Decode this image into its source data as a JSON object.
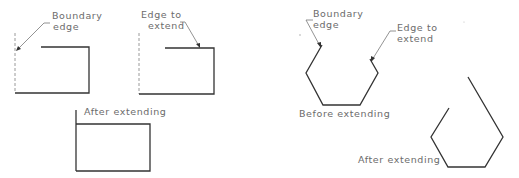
{
  "figure": {
    "left_panel": {
      "before_boundary": {
        "label_line1": "Boundary",
        "label_line2": "edge"
      },
      "before_edge": {
        "label_line1": "Edge to",
        "label_line2": "extend"
      },
      "after": {
        "label": "After extending"
      }
    },
    "right_panel": {
      "before": {
        "boundary_label_line1": "Boundary",
        "boundary_label_line2": "edge",
        "edge_label_line1": "Edge to",
        "edge_label_line2": "extend",
        "caption": "Before extending"
      },
      "after": {
        "caption": "After extending"
      }
    },
    "colors": {
      "line": "#333333",
      "dashed": "#9a9a9a",
      "text": "#6b6b6b",
      "background": "#ffffff"
    }
  }
}
